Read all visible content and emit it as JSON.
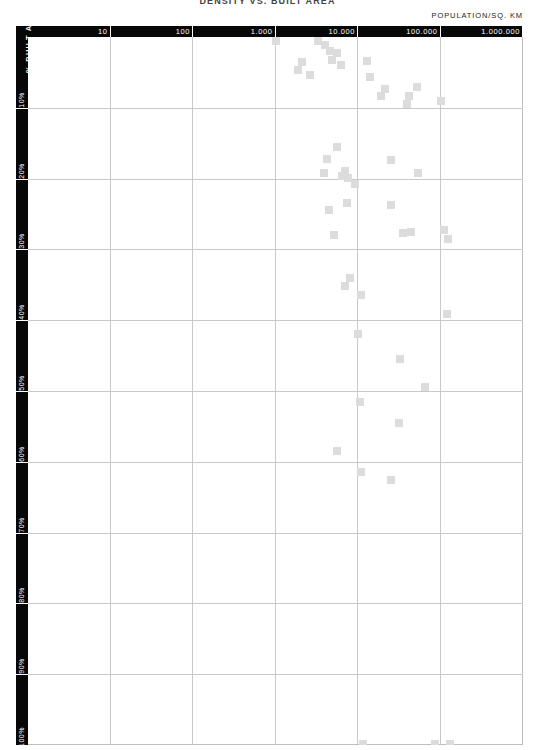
{
  "chart_data": {
    "type": "scatter",
    "title": "DENSITY VS. BUILT AREA",
    "xlabel": "POPULATION/SQ. KM",
    "ylabel": "% BUILT AREA",
    "x_scale": "log",
    "xlim": [
      1,
      1000000
    ],
    "ylim": [
      0,
      100
    ],
    "grid": true,
    "legend": "none",
    "marker": "square",
    "marker_color": "#dcdcdc",
    "xticks": [
      "10",
      "100",
      "1.000",
      "10.000",
      "100.000",
      "1.000.000"
    ],
    "xtick_values": [
      10,
      100,
      1000,
      10000,
      100000,
      1000000
    ],
    "yticks": [
      "10%",
      "20%",
      "30%",
      "40%",
      "50%",
      "60%",
      "70%",
      "80%",
      "90%",
      "100%"
    ],
    "ytick_values": [
      10,
      20,
      30,
      40,
      50,
      60,
      70,
      80,
      90,
      100
    ],
    "points": [
      {
        "x": 1000,
        "y": 0.5
      },
      {
        "x": 3300,
        "y": 0.6
      },
      {
        "x": 4000,
        "y": 1.2
      },
      {
        "x": 4600,
        "y": 2.0
      },
      {
        "x": 5600,
        "y": 2.3
      },
      {
        "x": 4900,
        "y": 3.2
      },
      {
        "x": 2100,
        "y": 3.6
      },
      {
        "x": 6200,
        "y": 4.0
      },
      {
        "x": 1900,
        "y": 4.6
      },
      {
        "x": 13000,
        "y": 3.4
      },
      {
        "x": 2600,
        "y": 5.4
      },
      {
        "x": 14000,
        "y": 5.6
      },
      {
        "x": 21000,
        "y": 7.4
      },
      {
        "x": 19000,
        "y": 8.3
      },
      {
        "x": 52000,
        "y": 7.0
      },
      {
        "x": 42000,
        "y": 8.4
      },
      {
        "x": 39000,
        "y": 9.5
      },
      {
        "x": 100000,
        "y": 9.0
      },
      {
        "x": 5500,
        "y": 15.5
      },
      {
        "x": 4200,
        "y": 17.3
      },
      {
        "x": 3900,
        "y": 19.2
      },
      {
        "x": 6400,
        "y": 19.6
      },
      {
        "x": 7000,
        "y": 18.9
      },
      {
        "x": 7600,
        "y": 19.9
      },
      {
        "x": 9200,
        "y": 20.8
      },
      {
        "x": 25000,
        "y": 17.4
      },
      {
        "x": 53000,
        "y": 19.2
      },
      {
        "x": 7300,
        "y": 23.5
      },
      {
        "x": 4400,
        "y": 24.4
      },
      {
        "x": 25000,
        "y": 23.7
      },
      {
        "x": 5100,
        "y": 28.0
      },
      {
        "x": 35000,
        "y": 27.7
      },
      {
        "x": 44000,
        "y": 27.6
      },
      {
        "x": 110000,
        "y": 27.3
      },
      {
        "x": 125000,
        "y": 28.5
      },
      {
        "x": 8000,
        "y": 34.0
      },
      {
        "x": 7000,
        "y": 35.2
      },
      {
        "x": 11000,
        "y": 36.5
      },
      {
        "x": 120000,
        "y": 39.1
      },
      {
        "x": 10000,
        "y": 42.0
      },
      {
        "x": 32000,
        "y": 45.5
      },
      {
        "x": 64000,
        "y": 49.5
      },
      {
        "x": 10500,
        "y": 51.5
      },
      {
        "x": 31000,
        "y": 54.5
      },
      {
        "x": 5600,
        "y": 58.5
      },
      {
        "x": 11000,
        "y": 61.5
      },
      {
        "x": 25000,
        "y": 62.5
      },
      {
        "x": 11500,
        "y": 99.8
      },
      {
        "x": 85000,
        "y": 99.8
      },
      {
        "x": 130000,
        "y": 99.8
      }
    ]
  }
}
